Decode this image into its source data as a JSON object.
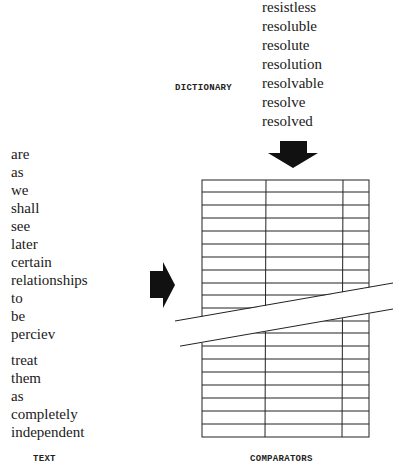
{
  "labels": {
    "dictionary": "DICTIONARY",
    "text": "TEXT",
    "comparators": "COMPARATORS"
  },
  "dictionary_words": [
    "resistless",
    "resoluble",
    "resolute",
    "resolution",
    "resolvable",
    "resolve",
    "resolved"
  ],
  "text_words_top": [
    "are",
    "as",
    "we",
    "shall",
    "see",
    "later",
    "certain",
    "relationships",
    "to",
    "be",
    "perciev"
  ],
  "text_words_bottom": [
    "treat",
    "them",
    "as",
    "completely",
    "independent"
  ],
  "icons": {
    "down_arrow": "arrow-down-icon",
    "right_arrow": "arrow-right-icon"
  },
  "colors": {
    "ink": "#1a1a1a",
    "background": "#ffffff"
  }
}
